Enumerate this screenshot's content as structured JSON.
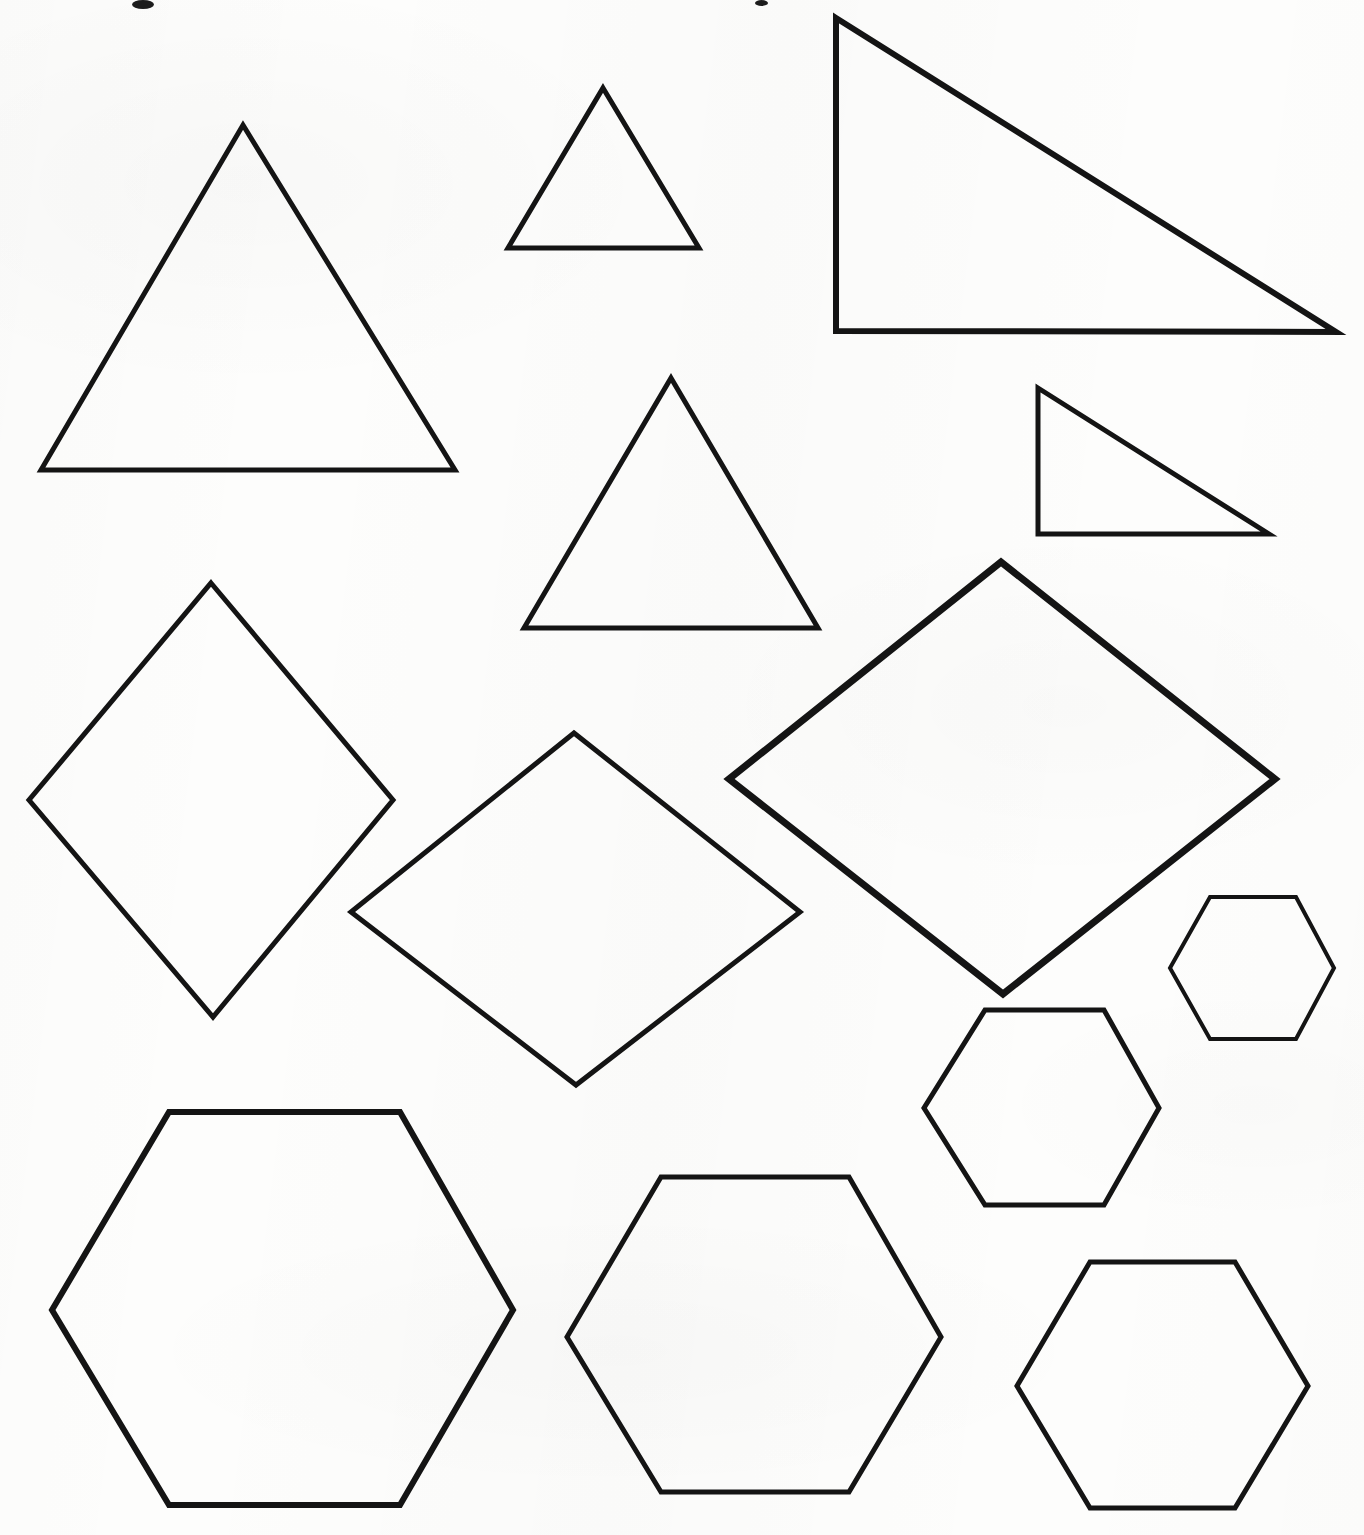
{
  "document": {
    "title": "Geometric Shapes Worksheet",
    "kind": "scanned-worksheet",
    "width": 1364,
    "height": 1535,
    "background_color": "#fdfdfc",
    "ink_color": "#141414",
    "has_text": false,
    "notes": "Scanned page of hand-drawn outline polygons: triangles, rhombi and hexagons. No labels or captions are printed on the page."
  },
  "chart_data": {
    "type": "scatter",
    "xlabel": "",
    "ylabel": "",
    "xlim": [
      0,
      1364
    ],
    "ylim": [
      0,
      1535
    ],
    "grid": false,
    "legend": "none",
    "shape_counts": {
      "triangles": 5,
      "rhombi": 3,
      "hexagons": 5,
      "total": 13
    },
    "shapes": [
      {
        "id": "triangle-equilateral-large",
        "family": "triangle",
        "variant": "equilateral",
        "size": "large",
        "stroke_width": 5,
        "points": "243,125 455,470 41,470"
      },
      {
        "id": "triangle-equilateral-small",
        "family": "triangle",
        "variant": "equilateral",
        "size": "small",
        "stroke_width": 5,
        "points": "603,88 699,248 508,248"
      },
      {
        "id": "triangle-right-large",
        "family": "triangle",
        "variant": "right",
        "size": "large",
        "stroke_width": 6,
        "points": "836,18 1336,332 836,331"
      },
      {
        "id": "triangle-equilateral-medium",
        "family": "triangle",
        "variant": "equilateral",
        "size": "medium",
        "stroke_width": 5,
        "points": "671,378 818,628 524,628"
      },
      {
        "id": "triangle-right-small",
        "family": "triangle",
        "variant": "right",
        "size": "small",
        "stroke_width": 5,
        "points": "1038,388 1269,534 1038,534"
      },
      {
        "id": "rhombus-tall-left",
        "family": "rhombus",
        "variant": "tall",
        "size": "medium",
        "stroke_width": 5,
        "points": "211,583 393,800 213,1017 29,800"
      },
      {
        "id": "rhombus-wide-center",
        "family": "rhombus",
        "variant": "wide",
        "size": "medium",
        "stroke_width": 5,
        "points": "574,733 800,912 576,1085 351,912"
      },
      {
        "id": "rhombus-large-right",
        "family": "rhombus",
        "variant": "wide",
        "size": "large",
        "stroke_width": 7,
        "points": "1001,562 1275,779 1003,994 729,779"
      },
      {
        "id": "hexagon-small-right",
        "family": "hexagon",
        "variant": "regular",
        "size": "small",
        "stroke_width": 4,
        "points": "1210,897 1296,897 1334,968 1296,1039 1210,1039 1170,968"
      },
      {
        "id": "hexagon-medium-right",
        "family": "hexagon",
        "variant": "regular",
        "size": "medium",
        "stroke_width": 5,
        "points": "985,1010 1104,1010 1159,1108 1104,1205 985,1205 924,1108"
      },
      {
        "id": "hexagon-large-left",
        "family": "hexagon",
        "variant": "regular",
        "size": "large",
        "stroke_width": 6,
        "points": "169,1112 400,1112 513,1310 400,1505 169,1505 52,1310"
      },
      {
        "id": "hexagon-medium-center-bottom",
        "family": "hexagon",
        "variant": "regular",
        "size": "medium",
        "stroke_width": 5,
        "points": "661,1177 849,1177 941,1337 849,1492 661,1492 567,1337"
      },
      {
        "id": "hexagon-medium-bottom-right",
        "family": "hexagon",
        "variant": "regular",
        "size": "medium",
        "stroke_width": 5,
        "points": "1090,1262 1235,1262 1308,1386 1235,1508 1090,1508 1017,1386"
      }
    ],
    "scan_artifacts": [
      {
        "id": "speck-top-left",
        "x": 132,
        "y": 0,
        "w": 22,
        "h": 9
      },
      {
        "id": "speck-top-center",
        "x": 755,
        "y": 0,
        "w": 13,
        "h": 6
      }
    ]
  }
}
